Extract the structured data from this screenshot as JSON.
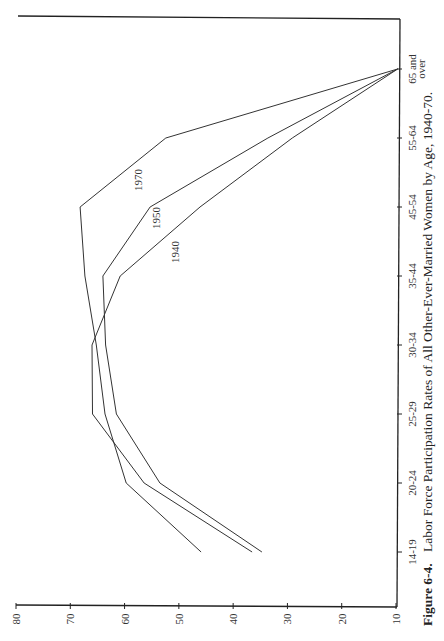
{
  "chart_data": {
    "type": "line",
    "orientation": "rotated-90-ccw",
    "title": "Figure 6-4.  Labor Force Participation Rates of All Other-Ever-Married Women by Age, 1940-70.",
    "figure_label": "Figure 6-4.",
    "caption_text": "Labor Force Participation Rates of All Other-Ever-Married Women by Age, 1940-70.",
    "xlabel": "",
    "ylabel": "",
    "categories": [
      "14-19",
      "20-24",
      "25-29",
      "30-34",
      "35-44",
      "45-54",
      "55-64",
      "65 and over"
    ],
    "category_label_lines": [
      [
        "14-19"
      ],
      [
        "20-24"
      ],
      [
        "25-29"
      ],
      [
        "30-34"
      ],
      [
        "35-44"
      ],
      [
        "45-54"
      ],
      [
        "55-64"
      ],
      [
        "65 and",
        "over"
      ]
    ],
    "yticks": [
      10,
      20,
      30,
      40,
      50,
      60,
      70,
      80
    ],
    "ylim": [
      10,
      80
    ],
    "grid": false,
    "legend": "inline labels",
    "series": [
      {
        "name": "1940",
        "values": [
          36.5,
          56.4,
          65.9,
          66.0,
          60.8,
          46.1,
          29.1,
          9.7
        ]
      },
      {
        "name": "1950",
        "values": [
          34.7,
          53.5,
          61.5,
          63.5,
          64.0,
          55.3,
          33.6,
          9.7
        ]
      },
      {
        "name": "1970",
        "values": [
          45.9,
          59.7,
          63.6,
          65.2,
          67.3,
          68.2,
          52.4,
          9.7
        ]
      }
    ],
    "annotations": [
      {
        "text": "1970",
        "near": "45-54"
      },
      {
        "text": "1950",
        "near": "45-54"
      },
      {
        "text": "1940",
        "near": "45-54"
      }
    ]
  },
  "colors": {
    "line": "#333333",
    "axis": "#222222",
    "background": "#ffffff"
  }
}
